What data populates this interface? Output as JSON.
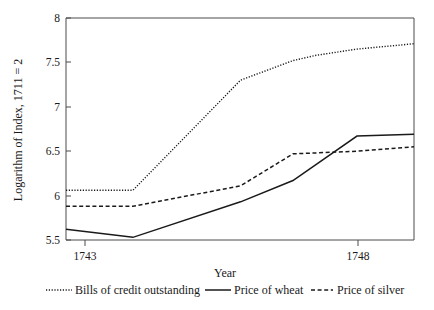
{
  "chart_data": {
    "type": "line",
    "title": "",
    "xlabel": "Year",
    "ylabel": "Logarithm of Index, 1711 = 2",
    "xlim": [
      1743,
      1748.98
    ],
    "ylim": [
      5.5,
      8
    ],
    "xticks": [
      1743,
      1748
    ],
    "xticklabels": [
      "1743",
      "1748"
    ],
    "yticks": [
      5.5,
      6,
      6.5,
      7,
      7.5,
      8
    ],
    "yticklabels": [
      "5.5",
      "6",
      "6.5",
      "7",
      "7.5",
      "8"
    ],
    "grid": false,
    "legend_position": "below",
    "x": [
      1743,
      1744.15,
      1745.0,
      1745.6,
      1746.0,
      1746.9,
      1747.3,
      1748.0,
      1748.98
    ],
    "series": [
      {
        "name": "Bills of credit outstanding",
        "style": "dotted",
        "color": "#1a1a1a",
        "x": [
          1743,
          1744.15,
          1746.0,
          1746.9,
          1747.3,
          1748.0,
          1748.98
        ],
        "values": [
          6.06,
          6.06,
          7.3,
          7.52,
          7.58,
          7.65,
          7.71
        ]
      },
      {
        "name": "Price of wheat",
        "style": "solid",
        "color": "#1a1a1a",
        "x": [
          1743,
          1744.15,
          1746.0,
          1746.9,
          1748.0,
          1748.98
        ],
        "values": [
          5.62,
          5.53,
          5.93,
          6.17,
          6.67,
          6.69
        ]
      },
      {
        "name": "Price of silver",
        "style": "dashed",
        "color": "#1a1a1a",
        "x": [
          1743,
          1744.15,
          1746.0,
          1746.9,
          1748.0,
          1748.98
        ],
        "values": [
          5.88,
          5.88,
          6.11,
          6.47,
          6.5,
          6.55
        ]
      }
    ]
  },
  "axes": {
    "ylabel": "Logarithm of Index, 1711 = 2",
    "xlabel": "Year",
    "ytick_0": "5.5",
    "ytick_1": "6",
    "ytick_2": "6.5",
    "ytick_3": "7",
    "ytick_4": "7.5",
    "ytick_5": "8",
    "xtick_0": "1743",
    "xtick_1": "1748"
  },
  "legend": {
    "items": [
      {
        "label": "Bills of credit outstanding",
        "style": "dotted"
      },
      {
        "label": "Price of wheat",
        "style": "solid"
      },
      {
        "label": "Price of silver",
        "style": "dashed"
      }
    ]
  },
  "colors": {
    "ink": "#1a1a1a",
    "frame": "#4a4a4a",
    "background": "#ffffff"
  }
}
